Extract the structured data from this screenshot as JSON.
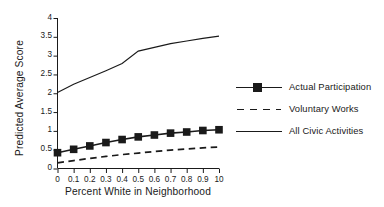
{
  "chart_data": {
    "type": "line",
    "title": "",
    "xlabel": "Percent White in Neighborhood",
    "ylabel": "Predicted Average Score",
    "xlim": [
      0,
      1.0
    ],
    "ylim": [
      0,
      4
    ],
    "grid": false,
    "legend_position": "right",
    "x": [
      0,
      0.1,
      0.2,
      0.3,
      0.4,
      0.5,
      0.6,
      0.7,
      0.8,
      0.9,
      1.0
    ],
    "xtick_labels": [
      "0",
      "0.1",
      "0.2",
      "0.3",
      "0.4",
      "0.5",
      "0.6",
      "0.7",
      "0.8",
      "0.9",
      "10"
    ],
    "ytick_labels": [
      "0",
      "0.5",
      "1",
      "1.5",
      "2",
      "2.5",
      "3",
      "3.5",
      "4"
    ],
    "ytick_values": [
      0,
      0.5,
      1,
      1.5,
      2,
      2.5,
      3,
      3.5,
      4
    ],
    "series": [
      {
        "name": "Actual Participation",
        "style": "solid-with-square-markers",
        "marker": "square",
        "values": [
          0.42,
          0.51,
          0.6,
          0.69,
          0.77,
          0.84,
          0.89,
          0.94,
          0.97,
          1.01,
          1.03
        ]
      },
      {
        "name": "Voluntary Works",
        "style": "dashed",
        "marker": "none",
        "values": [
          0.15,
          0.21,
          0.27,
          0.32,
          0.37,
          0.41,
          0.45,
          0.49,
          0.52,
          0.55,
          0.57
        ]
      },
      {
        "name": "All Civic Activities",
        "style": "solid-thin",
        "marker": "none",
        "values": [
          2.02,
          2.24,
          2.42,
          2.6,
          2.79,
          3.12,
          3.22,
          3.32,
          3.39,
          3.46,
          3.52
        ]
      }
    ]
  },
  "legend": {
    "items": [
      {
        "label": "Actual Participation"
      },
      {
        "label": "Voluntary Works"
      },
      {
        "label": "All Civic Activities"
      }
    ]
  }
}
